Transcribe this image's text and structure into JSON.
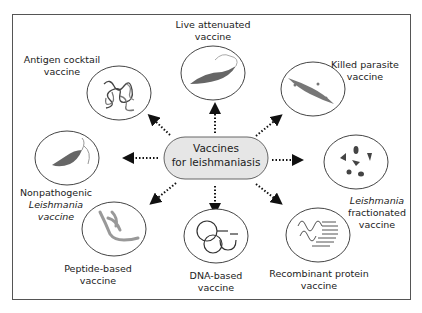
{
  "diagram": {
    "center": {
      "line1": "Vaccines",
      "line2": "for leishmaniasis"
    },
    "nodes": [
      {
        "id": "live",
        "line1": "Live attenuated",
        "line2": "vaccine"
      },
      {
        "id": "killed",
        "line1": "Killed parasite",
        "line2": "vaccine"
      },
      {
        "id": "fractionated",
        "line1": "Leishmania",
        "line2": "fractionated",
        "line3": "vaccine"
      },
      {
        "id": "recombinant",
        "line1": "Recombinant protein",
        "line2": "vaccine"
      },
      {
        "id": "dna",
        "line1": "DNA-based",
        "line2": "vaccine"
      },
      {
        "id": "peptide",
        "line1": "Peptide-based",
        "line2": "vaccine"
      },
      {
        "id": "nonpathogenic",
        "line1": "Nonpathogenic",
        "line2": "Leishmania",
        "line3": "vaccine"
      },
      {
        "id": "cocktail",
        "line1": "Antigen cocktail",
        "line2": "vaccine"
      }
    ],
    "colors": {
      "center_fill": "#e6e6e6",
      "stroke": "#444444",
      "parasite": "#777777",
      "frame": "#555555"
    }
  }
}
